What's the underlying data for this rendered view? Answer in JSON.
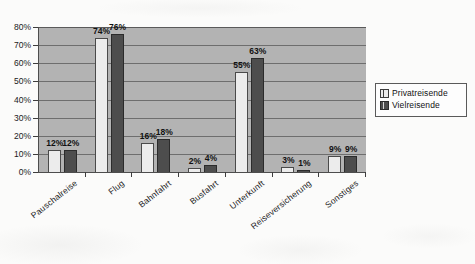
{
  "chart_data": {
    "type": "bar",
    "title": "",
    "subtitle": "",
    "xlabel": "",
    "ylabel": "",
    "ylim": [
      0,
      80
    ],
    "ytick_labels": [
      "0%",
      "10%",
      "20%",
      "30%",
      "40%",
      "50%",
      "60%",
      "70%",
      "80%"
    ],
    "ytick_values": [
      0,
      10,
      20,
      30,
      40,
      50,
      60,
      70,
      80
    ],
    "grid": true,
    "legend_position": "right",
    "categories": [
      "Pauschalreise",
      "Flug",
      "Bahnfahrt",
      "Busfahrt",
      "Unterkunft",
      "Reiseversicherung",
      "Sonstiges"
    ],
    "series": [
      {
        "name": "Privatreisende",
        "color": "#ececec",
        "values": [
          12,
          74,
          16,
          2,
          55,
          3,
          9
        ],
        "value_labels": [
          "12%",
          "74%",
          "16%",
          "2%",
          "55%",
          "3%",
          "9%"
        ]
      },
      {
        "name": "Vielreisende",
        "color": "#4d4d4d",
        "values": [
          12,
          76,
          18,
          4,
          63,
          1,
          9
        ],
        "value_labels": [
          "12%",
          "76%",
          "18%",
          "4%",
          "63%",
          "1%",
          "9%"
        ]
      }
    ],
    "plot_background": "#b3b3b3",
    "axis_color": "#4d4d4d"
  },
  "legend": {
    "items": [
      {
        "label": "Privatreisende",
        "swatch": "light"
      },
      {
        "label": "Vielreisende",
        "swatch": "dark"
      }
    ]
  }
}
